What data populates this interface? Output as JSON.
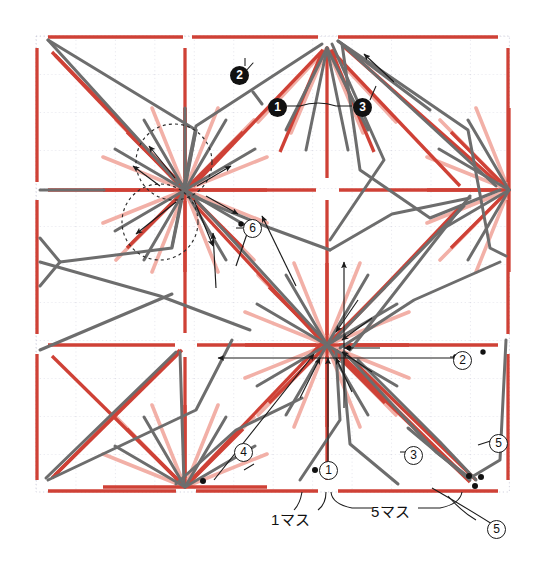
{
  "diagram": {
    "type": "crease-pattern",
    "sheet": {
      "x": 36,
      "y": 36,
      "width": 473,
      "height": 456,
      "grid_cols": 12,
      "grid_rows": 12,
      "grid_style": "dotted",
      "grid_color": "#c9c9d8"
    },
    "colors": {
      "mountain": "#cf4136",
      "mountain_light": "#f0a9a0",
      "valley": "#6d6d6d",
      "valley_light": "#a9a9a9",
      "annotation": "#1a1a1a",
      "grid": "#c9c9d8",
      "background": "#ffffff"
    },
    "vertices": [
      {
        "name": "top-center-star",
        "x": 327,
        "y": 48
      },
      {
        "name": "left-center-star",
        "x": 185,
        "y": 190
      },
      {
        "name": "right-center-star",
        "x": 509,
        "y": 190
      },
      {
        "name": "main-center-star",
        "x": 327,
        "y": 345
      },
      {
        "name": "bottom-center-star",
        "x": 185,
        "y": 487
      }
    ],
    "dashed_circles": [
      {
        "cx": 174,
        "cy": 162,
        "r": 38
      },
      {
        "cx": 160,
        "cy": 222,
        "r": 38
      }
    ]
  },
  "labels": {
    "filled": [
      {
        "id": "label-1-filled",
        "text": "1",
        "glyph": "❶",
        "x": 277,
        "y": 107
      },
      {
        "id": "label-2-filled",
        "text": "2",
        "glyph": "❷",
        "x": 239,
        "y": 75
      },
      {
        "id": "label-3-filled",
        "text": "3",
        "glyph": "❸",
        "x": 362,
        "y": 107
      }
    ],
    "ringed": [
      {
        "id": "label-1-ring",
        "text": "1",
        "glyph": "①",
        "x": 328,
        "y": 470
      },
      {
        "id": "label-2-ring",
        "text": "2",
        "glyph": "②",
        "x": 462,
        "y": 360
      },
      {
        "id": "label-3-ring",
        "text": "3",
        "glyph": "③",
        "x": 413,
        "y": 455
      },
      {
        "id": "label-4-ring",
        "text": "4",
        "glyph": "④",
        "x": 243,
        "y": 452
      },
      {
        "id": "label-5-ring-a",
        "text": "5",
        "glyph": "⑤",
        "x": 498,
        "y": 443
      },
      {
        "id": "label-5-ring-b",
        "text": "5",
        "glyph": "⑤",
        "x": 496,
        "y": 529
      },
      {
        "id": "label-6-ring",
        "text": "6",
        "glyph": "⑥",
        "x": 252,
        "y": 228
      }
    ],
    "dimensions": [
      {
        "id": "dim-1-masu",
        "text": "1マス",
        "x": 292,
        "y": 518
      },
      {
        "id": "dim-5-masu",
        "text": "5マス",
        "x": 380,
        "y": 512
      }
    ]
  },
  "legend": {
    "mountain_label": "mountain fold (red)",
    "valley_label": "valley fold (gray)",
    "unit_label": "マス",
    "unit_meaning": "grid square"
  }
}
